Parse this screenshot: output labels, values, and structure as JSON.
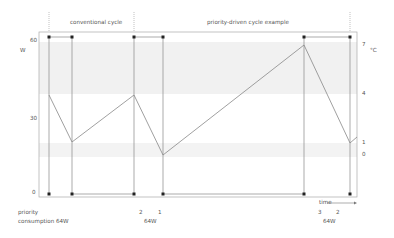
{
  "diagram": {
    "section_labels": {
      "conventional": "conventional cycle",
      "priority": "priority-driven cycle example"
    },
    "left_axis": {
      "unit": "W",
      "ticks": [
        "60",
        "30",
        "0"
      ]
    },
    "right_axis": {
      "unit": "°C",
      "ticks": [
        "7",
        "4",
        "1",
        "0"
      ]
    },
    "time_label": "time",
    "rows": {
      "priority_label": "priority",
      "consumption_label": "consumption",
      "priority_values": [
        "2",
        "1",
        "3",
        "2"
      ],
      "consumption_values": [
        "64W",
        "64W",
        "64W"
      ]
    },
    "colors": {
      "line": "#888888",
      "frame": "#999999",
      "marker": "#222222",
      "band": "#f0f0f0"
    }
  }
}
